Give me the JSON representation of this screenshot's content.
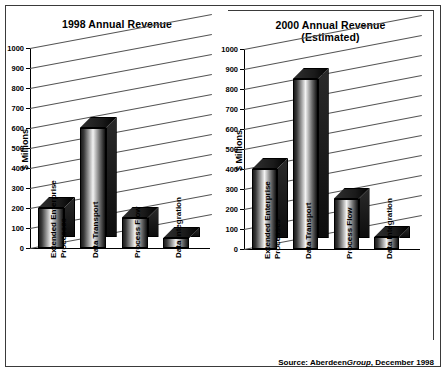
{
  "source_note": {
    "prefix": "Source: Aberdeen",
    "italic": "Group",
    "suffix": ", December 1998"
  },
  "axis": {
    "ylabel": "$ Millions",
    "ticks": [
      "0",
      "100",
      "200",
      "300",
      "400",
      "500",
      "600",
      "700",
      "800",
      "900",
      "1000"
    ]
  },
  "chart_data": [
    {
      "type": "bar",
      "title": "1998 Annual Revenue",
      "subtitle": "",
      "xlabel": "",
      "ylabel": "$ Millions",
      "ylim": [
        0,
        1000
      ],
      "ytick_step": 100,
      "grid": true,
      "legend": "none",
      "categories": [
        "Extended Enterprise Processes",
        "Data Transport",
        "Process Flow",
        "Data Integration"
      ],
      "category_lines": [
        [
          "Extended Enterprise",
          "Processes"
        ],
        [
          "Data Transport"
        ],
        [
          "Process Flow"
        ],
        [
          "Data Integration"
        ]
      ],
      "values": [
        200,
        600,
        150,
        50
      ]
    },
    {
      "type": "bar",
      "title": "2000 Annual Revenue",
      "subtitle": "(Estimated)",
      "xlabel": "",
      "ylabel": "$ Millions",
      "ylim": [
        0,
        1000
      ],
      "ytick_step": 100,
      "grid": true,
      "legend": "none",
      "categories": [
        "Extended Enterprise Processes",
        "Data Transport",
        "Process Flow",
        "Data Integration"
      ],
      "category_lines": [
        [
          "Extended Enterprise",
          "Processes"
        ],
        [
          "Data Transport"
        ],
        [
          "Process Flow"
        ],
        [
          "Data Integration"
        ]
      ],
      "values": [
        400,
        850,
        250,
        60
      ]
    }
  ]
}
